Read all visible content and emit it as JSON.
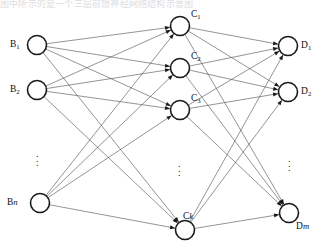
{
  "header": {
    "partial_text": "图中所示的是一个三层前馈神经网络结构示意图"
  },
  "diagram": {
    "canvas": {
      "width": 323,
      "height": 245
    },
    "style": {
      "node_fill": "#ffffff",
      "node_stroke": "#1a1a1a",
      "edge_stroke": "#52525a",
      "label_color": "#111111",
      "background": "#ffffff",
      "node_radius": 9.5,
      "edge_width": 0.62
    },
    "layers": [
      {
        "id": "input",
        "name": "input-layer",
        "x": 38,
        "label_side": "left",
        "nodes": [
          {
            "id": "B1",
            "base": "B",
            "sub": "1",
            "italic_sub": false,
            "x": 37,
            "y": 45,
            "label_x": 10,
            "label_y": 40
          },
          {
            "id": "B2",
            "base": "B",
            "sub": "2",
            "italic_sub": false,
            "x": 37,
            "y": 90,
            "label_x": 10,
            "label_y": 85
          },
          {
            "id": "Bn",
            "base": "B",
            "sub": "n",
            "italic_sub": true,
            "x": 40,
            "y": 203,
            "label_x": 7,
            "label_y": 198
          }
        ],
        "ellipsis": {
          "x": 36,
          "y": 152
        }
      },
      {
        "id": "hidden",
        "name": "hidden-layer",
        "x": 181,
        "label_side": "top-right",
        "nodes": [
          {
            "id": "C1",
            "base": "C",
            "sub": "1",
            "italic_sub": false,
            "x": 180,
            "y": 26,
            "label_x": 191,
            "label_y": 10
          },
          {
            "id": "C2",
            "base": "C",
            "sub": "2",
            "italic_sub": false,
            "x": 180,
            "y": 68,
            "label_x": 191,
            "label_y": 52
          },
          {
            "id": "C3",
            "base": "C",
            "sub": "3",
            "italic_sub": false,
            "x": 180,
            "y": 110,
            "label_x": 191,
            "label_y": 94
          },
          {
            "id": "Ck",
            "base": "C",
            "sub": "k",
            "italic_sub": true,
            "x": 185,
            "y": 230,
            "label_x": 183,
            "label_y": 212
          }
        ],
        "ellipsis": {
          "x": 178,
          "y": 162
        }
      },
      {
        "id": "output",
        "name": "output-layer",
        "x": 288,
        "label_side": "right",
        "nodes": [
          {
            "id": "D1",
            "base": "D",
            "sub": "1",
            "italic_sub": false,
            "x": 288,
            "y": 46,
            "label_x": 301,
            "label_y": 41
          },
          {
            "id": "D2",
            "base": "D",
            "sub": "2",
            "italic_sub": false,
            "x": 288,
            "y": 92,
            "label_x": 301,
            "label_y": 87
          },
          {
            "id": "Dm",
            "base": "D",
            "sub": "m",
            "italic_sub": true,
            "x": 289,
            "y": 213,
            "label_x": 296,
            "label_y": 222
          }
        ],
        "ellipsis": {
          "x": 288,
          "y": 157
        }
      }
    ],
    "connections": {
      "description": "fully connected between adjacent layers, directed left to right",
      "input_to_hidden": [
        [
          "B1",
          "C1"
        ],
        [
          "B1",
          "C2"
        ],
        [
          "B1",
          "C3"
        ],
        [
          "B1",
          "Ck"
        ],
        [
          "B2",
          "C1"
        ],
        [
          "B2",
          "C2"
        ],
        [
          "B2",
          "C3"
        ],
        [
          "B2",
          "Ck"
        ],
        [
          "Bn",
          "C1"
        ],
        [
          "Bn",
          "C2"
        ],
        [
          "Bn",
          "C3"
        ],
        [
          "Bn",
          "Ck"
        ]
      ],
      "hidden_to_output": [
        [
          "C1",
          "D1"
        ],
        [
          "C1",
          "D2"
        ],
        [
          "C1",
          "Dm"
        ],
        [
          "C2",
          "D1"
        ],
        [
          "C2",
          "D2"
        ],
        [
          "C2",
          "Dm"
        ],
        [
          "C3",
          "D1"
        ],
        [
          "C3",
          "D2"
        ],
        [
          "C3",
          "Dm"
        ],
        [
          "Ck",
          "D1"
        ],
        [
          "Ck",
          "D2"
        ],
        [
          "Ck",
          "Dm"
        ]
      ]
    },
    "ellipsis_glyph": "⋮"
  }
}
